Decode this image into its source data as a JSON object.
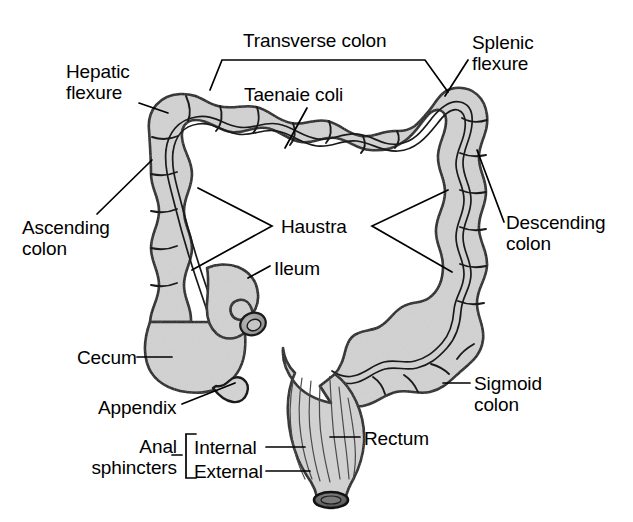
{
  "figure": {
    "background_color": "#ffffff",
    "organ_fill_color": "#d2d2d2",
    "outline_color": "#1a1a1a",
    "label_color": "#000000"
  },
  "labels": {
    "transverse_colon": "Transverse colon",
    "taenaie_coli": "Taenaie coli",
    "hepatic_flexure": "Hepatic\nflexure",
    "splenic_flexure": "Splenic\nflexure",
    "ascending_colon": "Ascending\ncolon",
    "descending_colon": "Descending\ncolon",
    "haustra": "Haustra",
    "ileum": "Ileum",
    "cecum": "Cecum",
    "appendix": "Appendix",
    "sigmoid_colon": "Sigmoid\ncolon",
    "rectum": "Rectum",
    "anal_sphincters": "Anal\nsphincters",
    "internal_sphincter": "Internal",
    "external_sphincter": "External"
  },
  "structures": [
    {
      "name": "ascending-colon",
      "label": "Ascending colon"
    },
    {
      "name": "transverse-colon",
      "label": "Transverse colon"
    },
    {
      "name": "descending-colon",
      "label": "Descending colon"
    },
    {
      "name": "sigmoid-colon",
      "label": "Sigmoid colon"
    },
    {
      "name": "cecum",
      "label": "Cecum"
    },
    {
      "name": "appendix",
      "label": "Appendix"
    },
    {
      "name": "ileum",
      "label": "Ileum"
    },
    {
      "name": "rectum",
      "label": "Rectum"
    },
    {
      "name": "hepatic-flexure",
      "label": "Hepatic flexure"
    },
    {
      "name": "splenic-flexure",
      "label": "Splenic flexure"
    },
    {
      "name": "taenia-coli",
      "label": "Taenaie coli"
    },
    {
      "name": "haustra",
      "label": "Haustra"
    },
    {
      "name": "anal-sphincters",
      "label": "Anal sphincters"
    }
  ]
}
